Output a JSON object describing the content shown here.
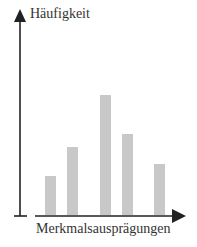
{
  "chart_data": {
    "type": "bar",
    "title": "",
    "xlabel": "Merkmalsausprägungen",
    "ylabel": "Häufigkeit",
    "categories": [
      "1",
      "2",
      "3",
      "4",
      "5"
    ],
    "values": [
      39,
      68,
      120,
      81,
      51
    ],
    "grid": false,
    "legend": null,
    "bar_color": "#c8c8c8",
    "axis_color": "#222222"
  }
}
